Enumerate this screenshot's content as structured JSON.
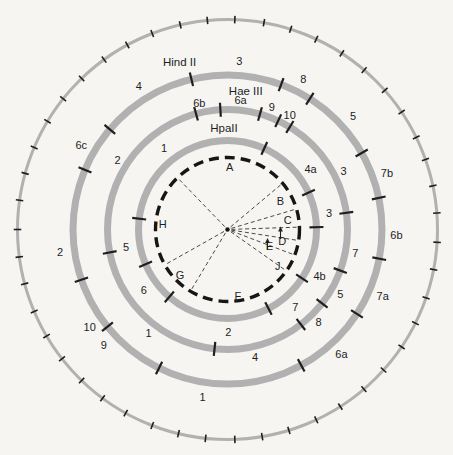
{
  "canvas": {
    "width": 453,
    "height": 455,
    "cx": 227.5,
    "cy": 229.5,
    "background": "#f6f5f2",
    "band_color": "#b1b1b1",
    "ink": "#1d1d1d",
    "tick_color": "#1f1f1f",
    "dashed_circle_color": "#161616",
    "boundary_line_color": "#3f3f3f"
  },
  "chart_data": {
    "type": "circular-restriction-map",
    "outer_ring": {
      "radius": 210,
      "band_width": 3,
      "tick_length": 7.5,
      "tick_angles": [
        2,
        10,
        17.5,
        25,
        33,
        40.6,
        48.5,
        56,
        64,
        70.5,
        78,
        85.5,
        93.5,
        101,
        109,
        116.5,
        124,
        132,
        139.5,
        147.5,
        155,
        163,
        170.5,
        178,
        186,
        193.5,
        201,
        209,
        216.5,
        224,
        232,
        239.5,
        247,
        255,
        262.5,
        270,
        278,
        285.5,
        293,
        301,
        308.5,
        316,
        324,
        331.5,
        339,
        347,
        354.5
      ]
    },
    "enzyme_rings": [
      {
        "enzyme": "Hind II",
        "name_angle": 344,
        "name_radius": 174,
        "radius": 154.5,
        "band_width": 7,
        "label_radius": 169,
        "fragments": [
          {
            "label": "3",
            "angle": 4
          },
          {
            "label": "8",
            "angle": 26.7
          },
          {
            "label": "5",
            "angle": 48
          },
          {
            "label": "7b",
            "angle": 70.6
          },
          {
            "label": "6b",
            "angle": 91.7
          },
          {
            "label": "7a",
            "angle": 113.3
          },
          {
            "label": "6a",
            "angle": 137.6
          },
          {
            "label": "1",
            "angle": 188.5
          },
          {
            "label": "9",
            "angle": 227.1
          },
          {
            "label": "10",
            "angle": 234.6
          },
          {
            "label": "2",
            "angle": 262.4
          },
          {
            "label": "6c",
            "angle": 300.1
          },
          {
            "label": "4",
            "angle": 328.3
          }
        ],
        "boundary_tick_angles": [
          20.3,
          32.2,
          60.3,
          78.2,
          100.9,
          123.1,
          151.5,
          206.3,
          231,
          251,
          292.7,
          310.4,
          346.5
        ]
      },
      {
        "enzyme": "Hae III",
        "name_angle": 7.5,
        "name_radius": 140,
        "radius": 120,
        "band_width": 7,
        "label_radius": 130,
        "fragments": [
          {
            "label": "6a",
            "angle": 5.8
          },
          {
            "label": "9",
            "angle": 19.9
          },
          {
            "label": "10",
            "angle": 28.6
          },
          {
            "label": "3",
            "angle": 63.2
          },
          {
            "label": "7",
            "angle": 100.4
          },
          {
            "label": "5",
            "angle": 119.9
          },
          {
            "label": "8",
            "angle": 135.6
          },
          {
            "label": "4",
            "angle": 167.8
          },
          {
            "label": "1",
            "angle": 217.4
          },
          {
            "label": "2",
            "angle": 302.2
          },
          {
            "label": "6b",
            "angle": 347.5
          }
        ],
        "boundary_tick_angles": [
          15.7,
          25,
          31.3,
          82,
          110,
          128,
          142.3,
          186.2,
          259,
          344.8,
          356.6
        ]
      },
      {
        "enzyme": "HpaII",
        "name_angle": 358,
        "name_radius": 102,
        "radius": 89,
        "band_width": 7,
        "label_radius": 103,
        "fragments": [
          {
            "label": "1",
            "angle": 322
          },
          {
            "label": "4a",
            "angle": 53.7
          },
          {
            "label": "3",
            "angle": 80.6
          },
          {
            "label": "4b",
            "angle": 116.6
          },
          {
            "label": "7",
            "angle": 138.9
          },
          {
            "label": "2",
            "angle": 179.5
          },
          {
            "label": "6",
            "angle": 234.3
          },
          {
            "label": "5",
            "angle": 260.4
          }
        ],
        "boundary_tick_angles": [
          24.4,
          65.5,
          88.5,
          123.2,
          152.6,
          220.8,
          247,
          277
        ]
      }
    ],
    "inner_dashed_circle": {
      "radius": 72,
      "dash": "10 6",
      "stroke_width": 3.4,
      "letters": [
        {
          "label": "A",
          "angle": 2,
          "radius": 63
        },
        {
          "label": "B",
          "angle": 62,
          "radius": 60
        },
        {
          "label": "C",
          "angle": 81,
          "radius": 61
        },
        {
          "label": "D",
          "angle": 102,
          "radius": 56
        },
        {
          "label": "E",
          "angle": 111,
          "radius": 45
        },
        {
          "label": "J",
          "angle": 126,
          "radius": 62
        },
        {
          "label": "F",
          "angle": 171,
          "radius": 67
        },
        {
          "label": "G",
          "angle": 226,
          "radius": 66
        },
        {
          "label": "H",
          "angle": 275,
          "radius": 65
        },
        {
          "label": "A",
          "angle": -999,
          "radius": 0
        }
      ],
      "boundary_line_angles": [
        316,
        50,
        73.4,
        88.1,
        98.8,
        110.8,
        125.1,
        211,
        240.6
      ],
      "leader_arrows": [
        {
          "name": "arrow-to-segment-D",
          "x": 280.5,
          "y_from": 239,
          "y_to": 227.5
        },
        {
          "name": "arrow-to-segment-E",
          "x": 267.5,
          "y_from": 249.5,
          "y_to": 239
        }
      ]
    }
  }
}
